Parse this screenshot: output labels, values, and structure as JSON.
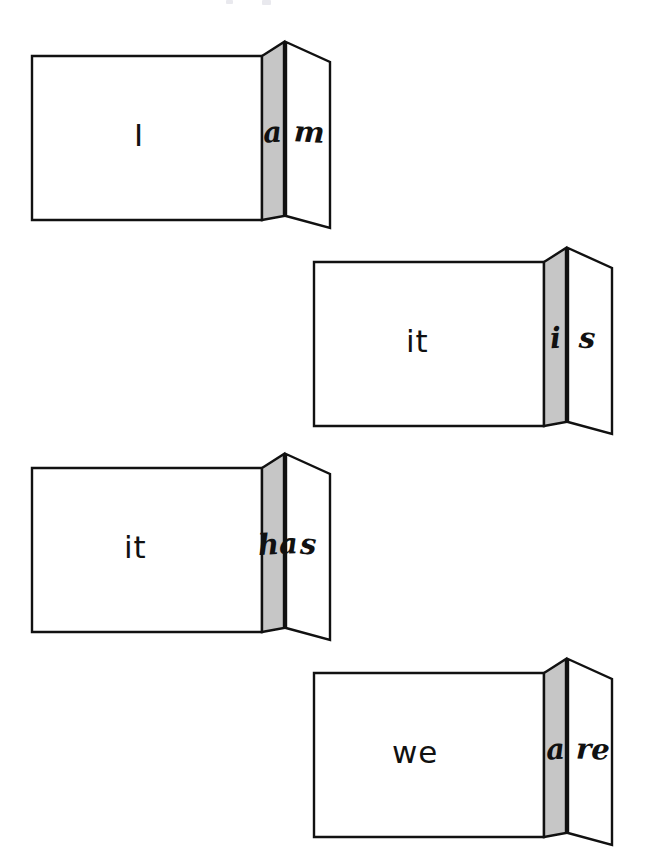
{
  "figure": {
    "kind": "folded-card-diagram",
    "background_color": "#ffffff",
    "stroke_color": "#111111",
    "front_panel_color": "#ffffff",
    "fold_panel_color": "#c6c6c6",
    "flap_panel_color": "#ffffff"
  },
  "cards": [
    {
      "id": "card-i-am",
      "front_label": "I",
      "fold_label": "a",
      "flap_label": "m",
      "full_phrase": "I am",
      "x": 22,
      "y": 38
    },
    {
      "id": "card-it-is",
      "front_label": "it",
      "fold_label": "i",
      "flap_label": "s",
      "full_phrase": "it is",
      "x": 304,
      "y": 244
    },
    {
      "id": "card-it-has",
      "front_label": "it",
      "fold_label": "ha",
      "flap_label": "s",
      "full_phrase": "it has",
      "x": 22,
      "y": 450
    },
    {
      "id": "card-we-are",
      "front_label": "we",
      "fold_label": "a",
      "flap_label": "re",
      "full_phrase": "we are",
      "x": 304,
      "y": 655
    }
  ],
  "top_artifacts": [
    {
      "x": 226,
      "y": 0,
      "w": 7,
      "h": 4
    },
    {
      "x": 262,
      "y": 0,
      "w": 9,
      "h": 5
    }
  ]
}
